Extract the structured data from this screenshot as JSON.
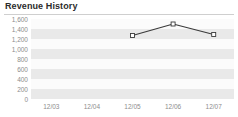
{
  "header": {
    "title": "Revenue History"
  },
  "chart_data": {
    "type": "line",
    "title": "Revenue History",
    "xlabel": "",
    "ylabel": "",
    "categories": [
      "12/03",
      "12/04",
      "12/05",
      "12/06",
      "12/07"
    ],
    "ytick_labels": [
      "1,600",
      "1,400",
      "1,200",
      "1,000",
      "800",
      "600",
      "400",
      "200",
      "0"
    ],
    "ytick_values": [
      1600,
      1400,
      1200,
      1000,
      800,
      600,
      400,
      200,
      0
    ],
    "ylim": [
      0,
      1600
    ],
    "grid": "horizontal-bands",
    "legend": "none",
    "series": [
      {
        "name": "Revenue",
        "x": [
          "12/03",
          "12/04",
          "12/05",
          "12/06",
          "12/07"
        ],
        "values": [
          null,
          null,
          1270,
          1500,
          1290
        ],
        "line_color": "#3a3a3a",
        "marker": "open-square",
        "marker_fill": "#ffffff",
        "marker_edge": "#3a3a3a"
      }
    ]
  },
  "style": {
    "background": "#ffffff",
    "band_shade": "#e9e9e9",
    "band_plain": "#fbfbfb",
    "rule_color": "#cfcfcf",
    "axis_label_color": "#8d8d8d",
    "title_color": "#2b2b2b"
  }
}
